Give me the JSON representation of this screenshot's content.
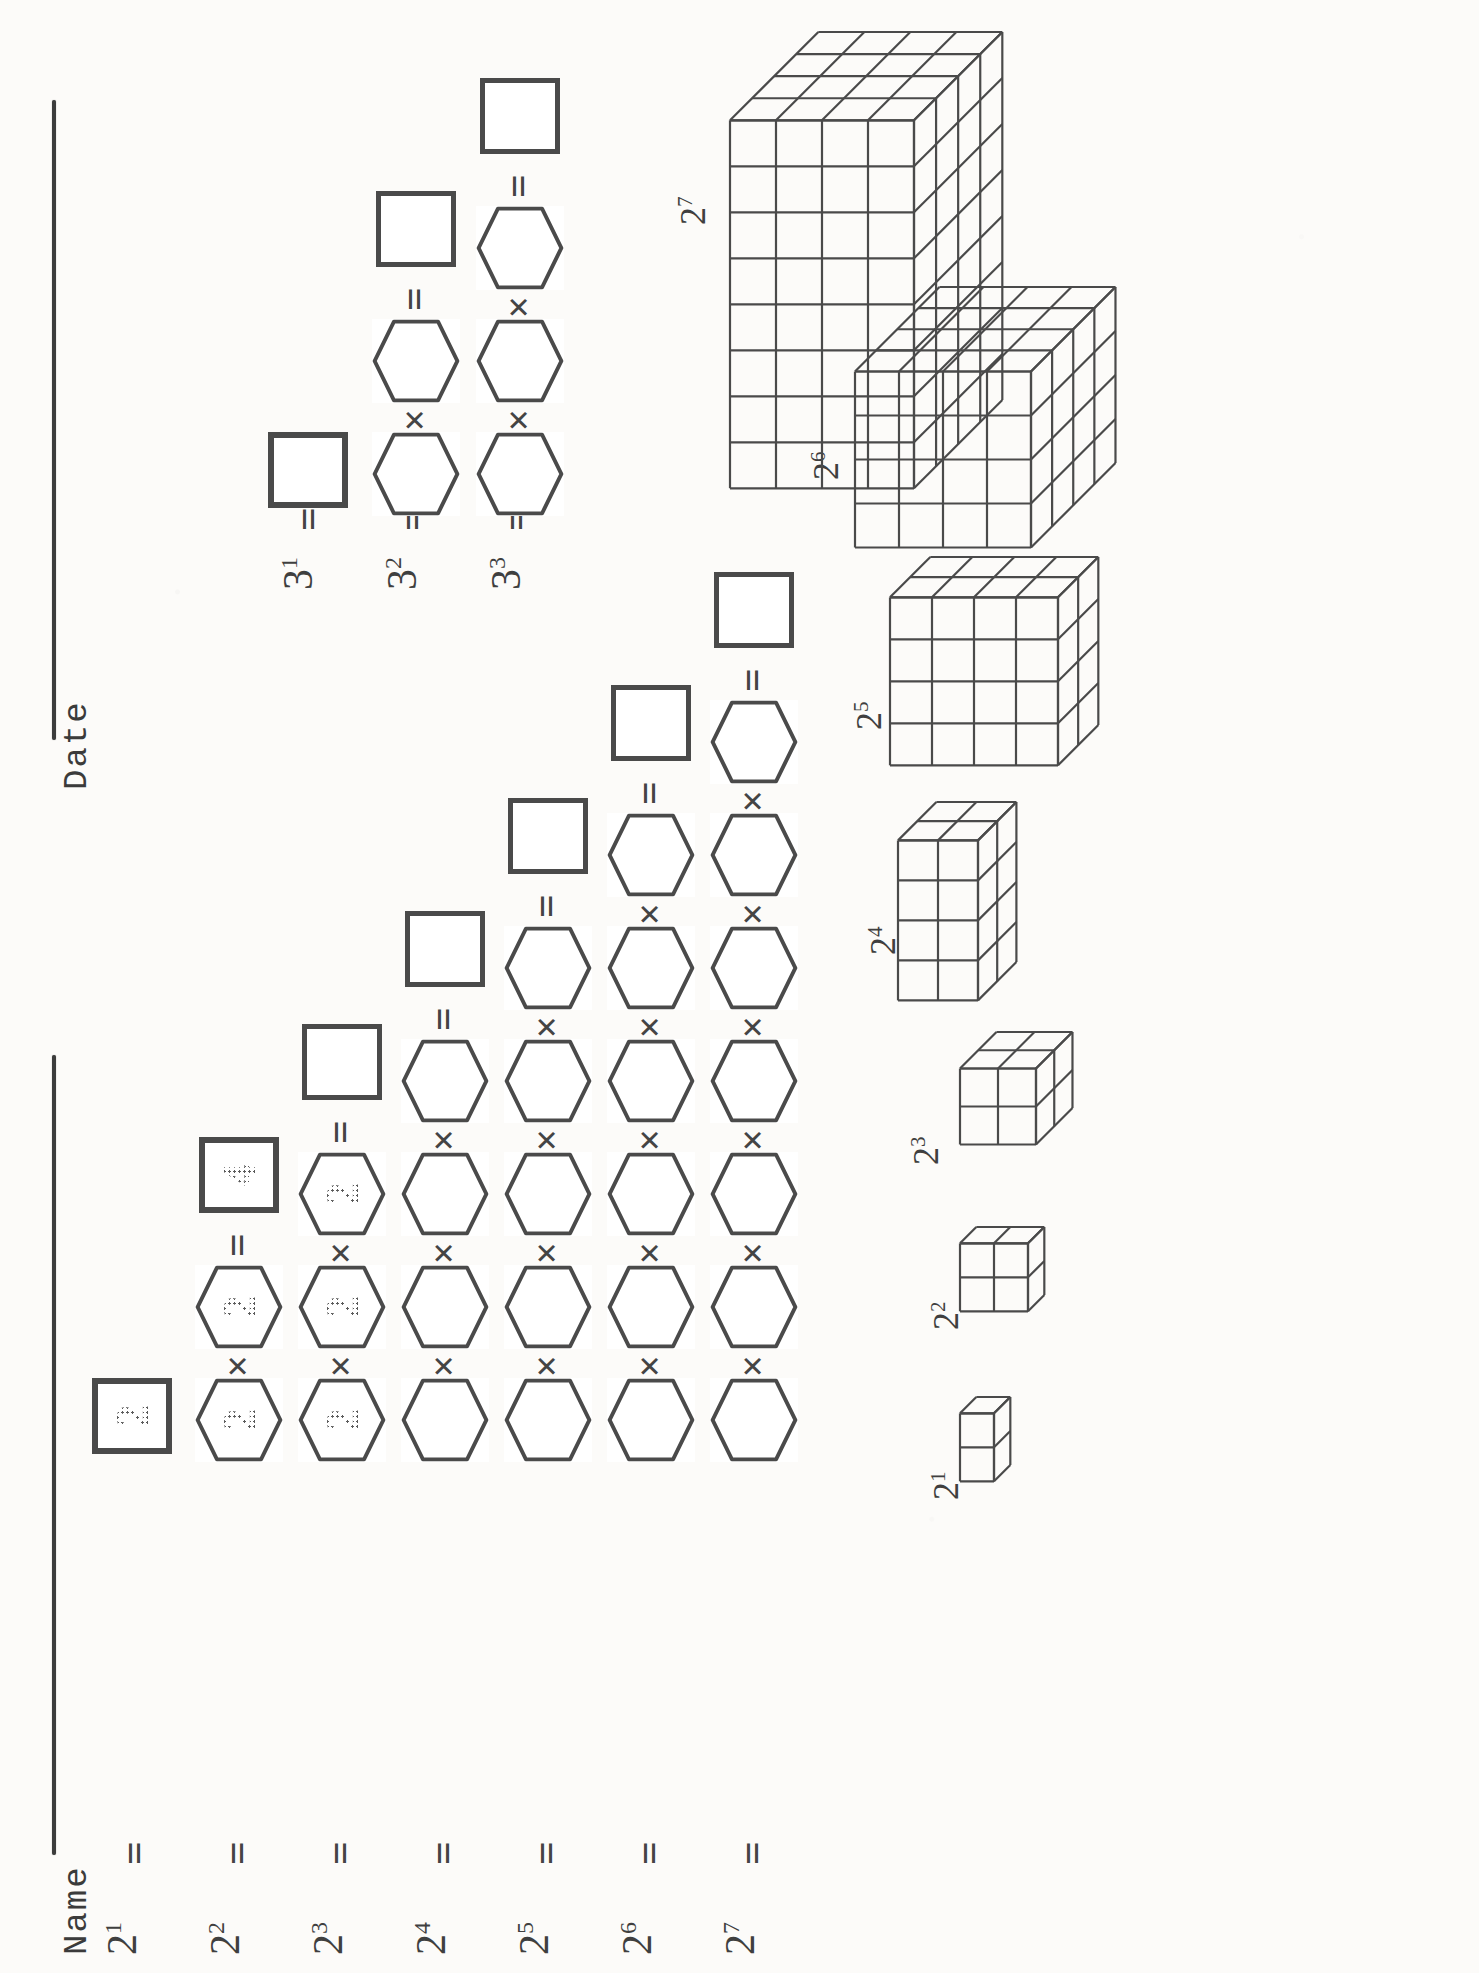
{
  "worksheet": {
    "orientation": "rotated-90-ccw",
    "header": {
      "name_label": "Name",
      "date_label": "Date"
    },
    "ink_color": "#4a4a4a",
    "paper_color": "#fcfbf9"
  },
  "powers_of_two": {
    "section_name": "powers-of-two-factor-tree",
    "base": "2",
    "rows": [
      {
        "label": "2",
        "exponent": "1",
        "factor_count": 1,
        "result_value": "2",
        "factors": [
          "2"
        ],
        "product_label": "2"
      },
      {
        "label": "2",
        "exponent": "2",
        "factor_count": 2,
        "result_value": "4",
        "factors": [
          "2",
          "2"
        ],
        "product_label": "4"
      },
      {
        "label": "2",
        "exponent": "3",
        "factor_count": 3,
        "result_value": "",
        "factors": [
          "2",
          "2",
          "2"
        ],
        "product_label": ""
      },
      {
        "label": "2",
        "exponent": "4",
        "factor_count": 4,
        "result_value": "",
        "factors": [
          "",
          "",
          "",
          ""
        ],
        "product_label": ""
      },
      {
        "label": "2",
        "exponent": "5",
        "factor_count": 5,
        "result_value": "",
        "factors": [
          "",
          "",
          "",
          "",
          ""
        ],
        "product_label": ""
      },
      {
        "label": "2",
        "exponent": "6",
        "factor_count": 6,
        "result_value": "",
        "factors": [
          "",
          "",
          "",
          "",
          "",
          ""
        ],
        "product_label": ""
      },
      {
        "label": "2",
        "exponent": "7",
        "factor_count": 7,
        "result_value": "",
        "factors": [
          "",
          "",
          "",
          "",
          "",
          "",
          ""
        ],
        "product_label": ""
      }
    ],
    "operators": {
      "equals": "=",
      "times": "×"
    }
  },
  "powers_of_three": {
    "section_name": "powers-of-three-factor-tree",
    "base": "3",
    "rows": [
      {
        "label": "3",
        "exponent": "1",
        "factor_count": 1,
        "result_value": "",
        "factors": [
          ""
        ],
        "product_label": ""
      },
      {
        "label": "3",
        "exponent": "2",
        "factor_count": 2,
        "result_value": "",
        "factors": [
          "",
          ""
        ],
        "product_label": ""
      },
      {
        "label": "3",
        "exponent": "3",
        "factor_count": 3,
        "result_value": "",
        "factors": [
          "",
          "",
          ""
        ],
        "product_label": ""
      }
    ],
    "operators": {
      "equals": "=",
      "times": "×"
    }
  },
  "cube_models": {
    "section_name": "isometric-volume-models",
    "items": [
      {
        "label": "2",
        "exponent": "1",
        "dims": [
          2,
          1,
          1
        ],
        "cells": 2
      },
      {
        "label": "2",
        "exponent": "2",
        "dims": [
          2,
          2,
          1
        ],
        "cells": 4
      },
      {
        "label": "2",
        "exponent": "3",
        "dims": [
          2,
          2,
          2
        ],
        "cells": 8
      },
      {
        "label": "2",
        "exponent": "4",
        "dims": [
          4,
          2,
          2
        ],
        "cells": 16
      },
      {
        "label": "2",
        "exponent": "5",
        "dims": [
          4,
          4,
          2
        ],
        "cells": 32
      },
      {
        "label": "2",
        "exponent": "6",
        "dims": [
          4,
          4,
          4
        ],
        "cells": 64
      },
      {
        "label": "2",
        "exponent": "7",
        "dims": [
          8,
          4,
          4
        ],
        "cells": 128
      }
    ]
  }
}
